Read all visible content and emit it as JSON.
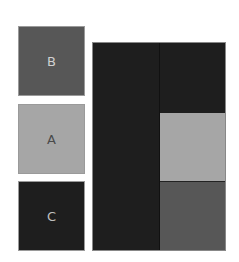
{
  "tiles": [
    {
      "label": "B",
      "color": "#575757",
      "text_color": "#d0d0d0"
    },
    {
      "label": "A",
      "color": "#a6a6a6",
      "text_color": "#4a4a4a"
    },
    {
      "label": "C",
      "color": "#1e1e1e",
      "text_color": "#c0c0c0"
    }
  ],
  "board": {
    "left_column_color": "#1e1e1e",
    "right_column": [
      "#1e1e1e",
      "#a6a6a6",
      "#575757"
    ]
  }
}
